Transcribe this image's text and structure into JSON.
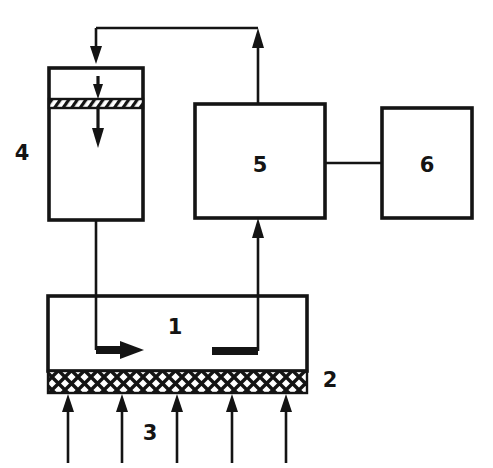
{
  "diagram": {
    "background_color": "#ffffff",
    "line_color": "#141414",
    "width": 493,
    "height": 468,
    "components": [
      {
        "id": "1",
        "label": "1",
        "name": "reaction-chamber",
        "shape": "rectangle",
        "x": 48,
        "y": 296,
        "w": 259,
        "h": 75,
        "label_x": 175,
        "label_y": 334
      },
      {
        "id": "2",
        "label": "2",
        "name": "mesh-distributor-plate",
        "shape": "hatched-band",
        "x": 48,
        "y": 371,
        "w": 259,
        "h": 22,
        "label_x": 330,
        "label_y": 387
      },
      {
        "id": "3",
        "label": "3",
        "name": "inlet-gas-arrows",
        "shape": "arrow-group",
        "count": 5,
        "label_x": 150,
        "label_y": 440
      },
      {
        "id": "4",
        "label": "4",
        "name": "column-vessel",
        "shape": "rectangle",
        "x": 49,
        "y": 68,
        "w": 94,
        "h": 152,
        "label_x": 22,
        "label_y": 160
      },
      {
        "id": "5",
        "label": "5",
        "name": "processing-unit",
        "shape": "rectangle",
        "x": 195,
        "y": 104,
        "w": 130,
        "h": 114,
        "label_x": 260,
        "label_y": 172
      },
      {
        "id": "6",
        "label": "6",
        "name": "output-unit",
        "shape": "rectangle",
        "x": 382,
        "y": 108,
        "w": 90,
        "h": 110,
        "label_x": 427,
        "label_y": 172
      }
    ],
    "connections": [
      {
        "name": "top-return-loop",
        "from": "5",
        "to": "4",
        "style": "thin",
        "arrowheads": [
          "down-into-4",
          "up-into-top-line"
        ]
      },
      {
        "name": "vessel-4-to-chamber-1",
        "from": "4",
        "to": "1",
        "style": "thin",
        "arrowheads": [
          "right-inside-chamber"
        ]
      },
      {
        "name": "chamber-1-to-unit-5",
        "from": "1",
        "to": "5",
        "style": "thin",
        "arrowheads": [
          "up-into-5"
        ]
      },
      {
        "name": "unit-5-to-unit-6",
        "from": "5",
        "to": "6",
        "style": "thin",
        "arrowheads": []
      },
      {
        "name": "internal-downflow-upper",
        "from": "4-top",
        "to": "4-band",
        "style": "med",
        "arrowheads": [
          "down"
        ]
      },
      {
        "name": "internal-downflow-lower",
        "from": "4-band",
        "to": "4-mid",
        "style": "med",
        "arrowheads": [
          "down"
        ]
      }
    ]
  }
}
